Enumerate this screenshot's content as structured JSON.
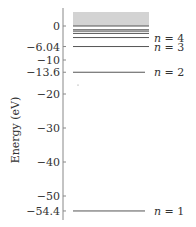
{
  "diagram": {
    "title": "",
    "axis": {
      "label": "Energy (eV)",
      "min": -56,
      "max": 4,
      "ticks": [
        {
          "value": 0,
          "label": "0"
        },
        {
          "value": -6.04,
          "label": "−6.04"
        },
        {
          "value": -10,
          "label": "−10"
        },
        {
          "value": -13.6,
          "label": "−13.6"
        },
        {
          "value": -20,
          "label": "−20"
        },
        {
          "value": -30,
          "label": "−30"
        },
        {
          "value": -40,
          "label": "−40"
        },
        {
          "value": -50,
          "label": "−50"
        },
        {
          "value": -54.4,
          "label": "−54.4"
        }
      ]
    },
    "continuum": {
      "description": "shaded ionization continuum above 0 eV",
      "color": "#d3d3d3"
    },
    "levels": [
      {
        "n": 1,
        "energy": -54.4,
        "label_var": "n",
        "label_eq": " = 1",
        "labeled": true
      },
      {
        "n": 2,
        "energy": -13.6,
        "label_var": "n",
        "label_eq": " = 2",
        "labeled": true
      },
      {
        "n": 3,
        "energy": -6.04,
        "label_var": "n",
        "label_eq": " = 3",
        "labeled": true
      },
      {
        "n": 4,
        "energy": -3.4,
        "label_var": "n",
        "label_eq": " = 4",
        "labeled": true
      },
      {
        "n": 5,
        "energy": -2.18,
        "labeled": false
      },
      {
        "n": 6,
        "energy": -1.51,
        "labeled": false
      },
      {
        "n": 7,
        "energy": -1.11,
        "labeled": false
      },
      {
        "n": "inf",
        "energy": 0,
        "labeled": false
      }
    ],
    "colors": {
      "line": "#555555",
      "axis": "#888888",
      "text": "#333333",
      "continuum": "#d3d3d3"
    }
  }
}
